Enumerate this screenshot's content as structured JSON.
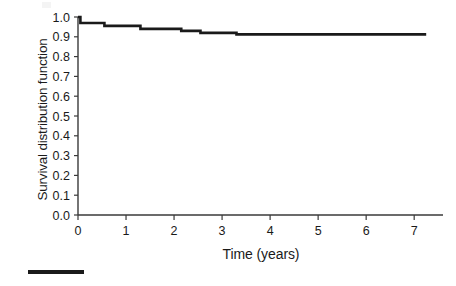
{
  "figure": {
    "name": "survival-distribution-plot",
    "line_color": "#1a1a1a",
    "axis_color": "#3a3a3a",
    "background": "#ffffff"
  },
  "chart_data": {
    "type": "line",
    "title": "",
    "subtitle": "",
    "xlabel": "Time (years)",
    "ylabel": "Survival distribution function",
    "xlim": [
      0,
      7.6
    ],
    "ylim": [
      0.0,
      1.0
    ],
    "xticks": [
      0,
      1,
      2,
      3,
      4,
      5,
      6,
      7
    ],
    "xticklabels": [
      "0",
      "1",
      "2",
      "3",
      "4",
      "5",
      "6",
      "7"
    ],
    "yticks": [
      0.0,
      0.1,
      0.2,
      0.3,
      0.4,
      0.5,
      0.6,
      0.7,
      0.8,
      0.9,
      1.0
    ],
    "yticklabels": [
      "0.0",
      "0.1",
      "0.2",
      "0.3",
      "0.4",
      "0.5",
      "0.6",
      "0.7",
      "0.8",
      "0.9",
      "1.0"
    ],
    "grid": false,
    "legend_position": "below-plot-left",
    "legend": [
      {
        "label": "",
        "color": "#1a1a1a",
        "style": "solid-line"
      }
    ],
    "step_style": "post",
    "series": [
      {
        "name": "survival-curve",
        "color": "#1a1a1a",
        "x": [
          0.0,
          0.05,
          0.55,
          1.3,
          2.15,
          2.55,
          3.3,
          7.25
        ],
        "y": [
          1.0,
          0.97,
          0.955,
          0.94,
          0.93,
          0.92,
          0.912,
          0.912
        ]
      }
    ],
    "annotations": []
  },
  "legend_key": {
    "name": "legend-line-key"
  }
}
